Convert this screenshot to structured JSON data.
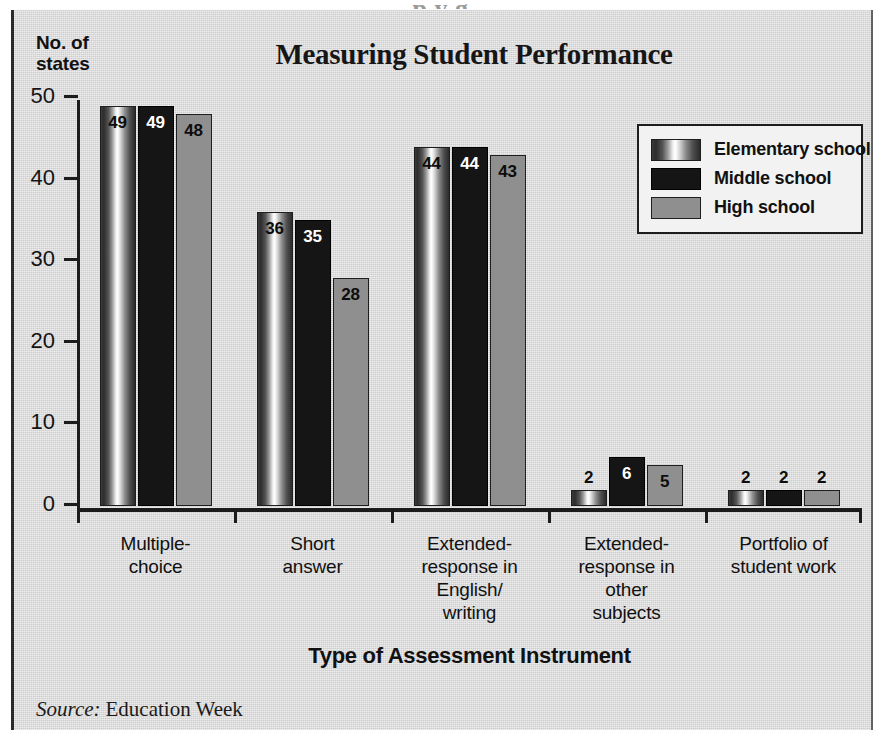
{
  "page": {
    "top_cropped_headline": "p y g",
    "background_color": "#dadada"
  },
  "figure": {
    "title": "Measuring Student Performance",
    "y_axis_label": "No. of\nstates",
    "x_axis_title": "Type of Assessment Instrument",
    "source_word": "Source:",
    "source_name": "Education Week"
  },
  "legend": {
    "items": [
      {
        "label": "Elementary school",
        "swatch": "elementary",
        "color": "#8d8d8d"
      },
      {
        "label": "Middle school",
        "swatch": "middle",
        "color": "#151515"
      },
      {
        "label": "High school",
        "swatch": "high",
        "color": "#8f8f8f"
      }
    ]
  },
  "chart_data": {
    "type": "bar",
    "title": "Measuring Student Performance",
    "xlabel": "Type of Assessment Instrument",
    "ylabel": "No. of states",
    "ylim": [
      0,
      50
    ],
    "yticks": [
      0,
      10,
      20,
      30,
      40,
      50
    ],
    "grid": false,
    "legend_position": "top-right",
    "categories": [
      "Multiple-\nchoice",
      "Short\nanswer",
      "Extended-\nresponse in\nEnglish/\nwriting",
      "Extended-\nresponse in\nother\nsubjects",
      "Portfolio of\nstudent work"
    ],
    "series": [
      {
        "name": "Elementary school",
        "values": [
          49,
          36,
          44,
          2,
          2
        ]
      },
      {
        "name": "Middle school",
        "values": [
          49,
          35,
          44,
          6,
          2
        ]
      },
      {
        "name": "High school",
        "values": [
          48,
          28,
          43,
          5,
          2
        ]
      }
    ]
  }
}
